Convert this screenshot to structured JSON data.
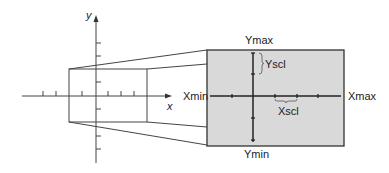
{
  "diagram": {
    "left_axes": {
      "x_label": "x",
      "y_label": "y"
    },
    "viewing_window": {
      "xmin_label": "Xmin",
      "xmax_label": "Xmax",
      "ymin_label": "Ymin",
      "ymax_label": "Ymax",
      "xscl_label": "Xscl",
      "yscl_label": "Yscl"
    },
    "colors": {
      "window_fill": "#d9d9d9",
      "line": "#333333"
    }
  }
}
